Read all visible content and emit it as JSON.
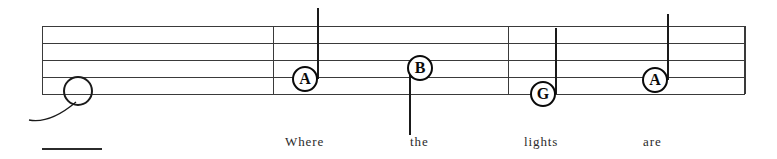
{
  "sheet": {
    "width": 777,
    "height": 159,
    "background_color": "#ffffff",
    "ink_color": "#3a3a3a",
    "note_color": "#0a0a0a"
  },
  "staff": {
    "line_count": 5,
    "left": 42,
    "right": 745,
    "line_y": [
      26,
      43,
      60,
      77,
      94
    ],
    "line_color": "#3a3a3a"
  },
  "barlines": [
    {
      "name": "opening-barline",
      "x": 42,
      "top": 26,
      "bottom": 94
    },
    {
      "name": "barline-1",
      "x": 273,
      "top": 26,
      "bottom": 94
    },
    {
      "name": "barline-2",
      "x": 508,
      "top": 26,
      "bottom": 94
    },
    {
      "name": "closing-barline",
      "x": 744,
      "top": 26,
      "bottom": 94
    }
  ],
  "whole_note": {
    "label": "whole-note",
    "center_x": 78,
    "center_y": 91,
    "diameter": 30
  },
  "notes": [
    {
      "letter": "A",
      "center_x": 305,
      "center_y": 79,
      "diameter": 26,
      "stem_direction": "up",
      "stem_x": 317,
      "stem_top": 8,
      "stem_bottom": 79
    },
    {
      "letter": "B",
      "center_x": 420,
      "center_y": 68,
      "diameter": 26,
      "stem_direction": "down",
      "stem_x": 409,
      "stem_top": 68,
      "stem_bottom": 135
    },
    {
      "letter": "G",
      "center_x": 543,
      "center_y": 94,
      "diameter": 26,
      "stem_direction": "up",
      "stem_x": 555,
      "stem_top": 28,
      "stem_bottom": 94
    },
    {
      "letter": "A",
      "center_x": 655,
      "center_y": 80,
      "diameter": 26,
      "stem_direction": "up",
      "stem_x": 667,
      "stem_top": 14,
      "stem_bottom": 80
    }
  ],
  "lyrics": [
    {
      "text": "Where",
      "x": 285,
      "y": 134
    },
    {
      "text": "the",
      "x": 410,
      "y": 134
    },
    {
      "text": "lights",
      "x": 524,
      "y": 134
    },
    {
      "text": "are",
      "x": 643,
      "y": 134
    }
  ],
  "underline_mark": {
    "x": 42,
    "y": 148,
    "width": 60
  }
}
